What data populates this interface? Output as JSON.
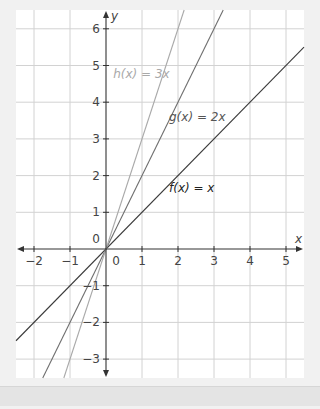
{
  "chart_data": {
    "type": "line",
    "title": "",
    "xlabel": "x",
    "ylabel": "y",
    "xlim": [
      -2.5,
      5.5
    ],
    "ylim": [
      -3.5,
      6.5
    ],
    "grid": true,
    "x_ticks": [
      -2,
      -1,
      0,
      1,
      2,
      3,
      4,
      5
    ],
    "y_ticks": [
      -3,
      -2,
      -1,
      0,
      1,
      2,
      3,
      4,
      5,
      6
    ],
    "x_tick_labels": [
      "−2",
      "−1",
      "0",
      "1",
      "2",
      "3",
      "4",
      "5"
    ],
    "y_tick_labels": [
      "−3",
      "−2",
      "−1",
      "0",
      "1",
      "2",
      "3",
      "4",
      "5",
      "6"
    ],
    "series": [
      {
        "name": "f(x) = x",
        "slope": 1,
        "color": "#3a3a3a",
        "label_pos": [
          1.75,
          1.55
        ]
      },
      {
        "name": "g(x) = 2x",
        "slope": 2,
        "color": "#6e6e6e",
        "label_pos": [
          1.75,
          3.5
        ]
      },
      {
        "name": "h(x) = 3x",
        "slope": 3,
        "color": "#a9a9a9",
        "label_pos": [
          0.2,
          4.65
        ]
      }
    ]
  },
  "labels": {
    "x_axis": "x",
    "y_axis": "y",
    "f": "f(x) = x",
    "g": "g(x) = 2x",
    "h": "h(x) = 3x"
  },
  "colors": {
    "grid": "#d2d2d2",
    "axis": "#333333",
    "plot_bg": "#ffffff",
    "page_bg": "#f1f1f1"
  }
}
